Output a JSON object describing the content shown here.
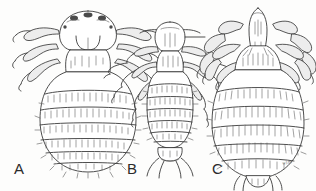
{
  "figure": {
    "kind": "scientific-line-drawing",
    "medium": "pen-and-ink stipple illustration",
    "background_color": "#fdfdfc",
    "ink_color": "#3a3a3a",
    "ink_light_color": "#6f6f6f",
    "label_color": "#2b2b2b"
  },
  "specimens": [
    {
      "id": "A",
      "label": "A",
      "label_x": 14,
      "label_y": 161,
      "common_description": "broad pear-shaped louse with rounded dome head, stout thorax and large oval banded abdomen",
      "head_shape": "rounded dome",
      "abdomen_shape": "broad oval",
      "leg_pairs": 3,
      "abdominal_bands": 7,
      "center_x": 88,
      "top_y": 12,
      "bottom_y": 176
    },
    {
      "id": "B",
      "label": "B",
      "label_x": 127,
      "label_y": 161,
      "common_description": "slender elongate louse with narrow head, long laterally splayed legs and rectangular segmented abdomen",
      "head_shape": "elongate oval",
      "abdomen_shape": "narrow rectangular",
      "leg_pairs": 3,
      "abdominal_bands": 7,
      "center_x": 170,
      "top_y": 22,
      "bottom_y": 172
    },
    {
      "id": "C",
      "label": "C",
      "label_x": 212,
      "label_y": 161,
      "common_description": "crab-shaped louse with small triangular head, robust clawed legs and very broad rounded abdomen with dense hair tufts",
      "head_shape": "narrow triangular",
      "abdomen_shape": "very broad rounded",
      "leg_pairs": 3,
      "abdominal_bands": 6,
      "center_x": 258,
      "top_y": 8,
      "bottom_y": 183
    }
  ],
  "signature": {
    "text": "wlm",
    "x": 282,
    "y": 160
  },
  "icons": {
    "louse_a": "louse-broad-icon",
    "louse_b": "louse-slender-icon",
    "louse_c": "louse-crab-icon"
  }
}
